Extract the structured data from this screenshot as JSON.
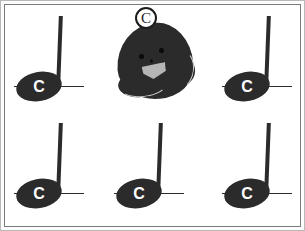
{
  "page": {
    "background_color": "#ffffff",
    "frame_color": "#7a7a7a",
    "ink_color": "#2b2b2b"
  },
  "mascot": {
    "name": "note-head-mascot",
    "badge_label": "C",
    "body_color": "#2b2b2b",
    "highlight_color": "#c8c8c8",
    "mouth_color": "#b5b5b5",
    "eye_color": "#0a0a0a"
  },
  "notes": [
    {
      "id": "note-1",
      "label": "C",
      "type": "quarter-note",
      "row": 1,
      "column": 1,
      "x": 14,
      "y": 11,
      "ledger": true
    },
    {
      "id": "note-2",
      "label": "C",
      "type": "quarter-note",
      "row": 1,
      "column": 3,
      "x": 222,
      "y": 11,
      "ledger": true
    },
    {
      "id": "note-3",
      "label": "C",
      "type": "quarter-note",
      "row": 2,
      "column": 1,
      "x": 14,
      "y": 118,
      "ledger": true
    },
    {
      "id": "note-4",
      "label": "C",
      "type": "quarter-note",
      "row": 2,
      "column": 2,
      "x": 114,
      "y": 118,
      "ledger": true
    },
    {
      "id": "note-5",
      "label": "C",
      "type": "quarter-note",
      "row": 2,
      "column": 3,
      "x": 222,
      "y": 118,
      "ledger": true
    }
  ]
}
